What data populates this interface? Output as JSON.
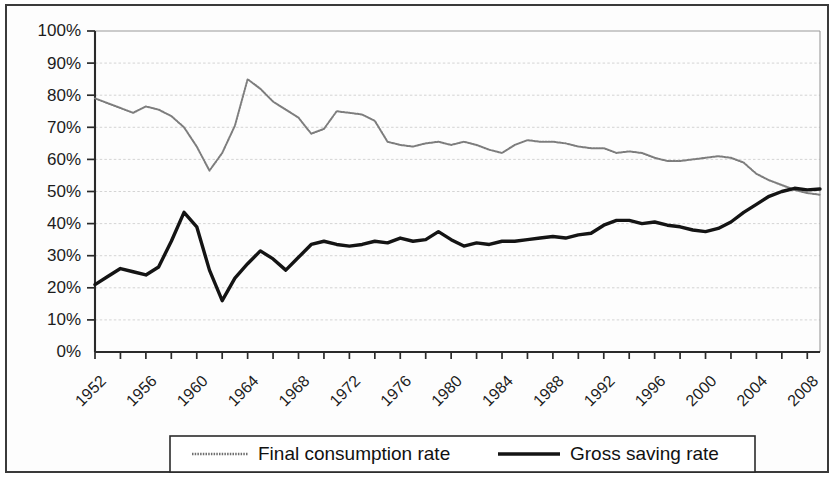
{
  "figure": {
    "width": 835,
    "height": 479,
    "background": "#ffffff",
    "frame_color": "#3a3a3a"
  },
  "legend": {
    "position": "bottom-center",
    "items": [
      {
        "label": "Final consumption rate",
        "marker": "dotted-line",
        "color": "#7d7d7d"
      },
      {
        "label": "Gross saving rate",
        "marker": "solid-line",
        "color": "#141414"
      }
    ]
  },
  "axes": {
    "y_ticks": [
      "0%",
      "10%",
      "20%",
      "30%",
      "40%",
      "50%",
      "60%",
      "70%",
      "80%",
      "90%",
      "100%"
    ],
    "x_ticks": [
      "1952",
      "1956",
      "1960",
      "1964",
      "1968",
      "1972",
      "1976",
      "1980",
      "1984",
      "1988",
      "1992",
      "1996",
      "2000",
      "2004",
      "2008"
    ],
    "x_tick_rotation": "-45"
  },
  "chart_data": {
    "type": "line",
    "title": "",
    "subtitle": "",
    "xlabel": "",
    "ylabel": "",
    "xlim": [
      1952,
      2009
    ],
    "ylim": [
      0,
      100
    ],
    "y_unit": "percent",
    "y_tick_step": 10,
    "x_tick_step": 4,
    "grid": true,
    "grid_axis": "y",
    "legend_position": "bottom-center",
    "x": [
      1952,
      1953,
      1954,
      1955,
      1956,
      1957,
      1958,
      1959,
      1960,
      1961,
      1962,
      1963,
      1964,
      1965,
      1966,
      1967,
      1968,
      1969,
      1970,
      1971,
      1972,
      1973,
      1974,
      1975,
      1976,
      1977,
      1978,
      1979,
      1980,
      1981,
      1982,
      1983,
      1984,
      1985,
      1986,
      1987,
      1988,
      1989,
      1990,
      1991,
      1992,
      1993,
      1994,
      1995,
      1996,
      1997,
      1998,
      1999,
      2000,
      2001,
      2002,
      2003,
      2004,
      2005,
      2006,
      2007,
      2008,
      2009
    ],
    "series": [
      {
        "name": "Final consumption rate",
        "color": "#7d7d7d",
        "style": "dotted",
        "values": [
          79.0,
          77.5,
          76.0,
          74.5,
          76.5,
          75.5,
          73.5,
          70.0,
          64.0,
          56.5,
          62.0,
          70.5,
          85.0,
          82.0,
          78.0,
          75.5,
          73.0,
          68.0,
          69.5,
          75.0,
          74.5,
          74.0,
          72.0,
          65.5,
          64.5,
          64.0,
          65.0,
          65.5,
          64.5,
          65.5,
          64.5,
          63.0,
          62.0,
          64.5,
          66.0,
          65.5,
          65.5,
          65.0,
          64.0,
          63.5,
          63.5,
          62.0,
          62.5,
          62.0,
          60.5,
          59.5,
          59.5,
          60.0,
          60.5,
          61.0,
          60.5,
          59.0,
          55.5,
          53.5,
          52.0,
          50.5,
          49.5,
          49.0
        ]
      },
      {
        "name": "Gross saving rate",
        "color": "#141414",
        "style": "solid",
        "values": [
          21.0,
          23.5,
          26.0,
          25.0,
          24.0,
          26.5,
          34.5,
          43.5,
          39.0,
          25.5,
          16.0,
          23.0,
          27.5,
          31.5,
          29.0,
          25.5,
          29.5,
          33.5,
          34.5,
          33.5,
          33.0,
          33.5,
          34.5,
          34.0,
          35.5,
          34.5,
          35.0,
          37.5,
          35.0,
          33.0,
          34.0,
          33.5,
          34.5,
          34.5,
          35.0,
          35.5,
          36.0,
          35.5,
          36.5,
          37.0,
          39.5,
          41.0,
          41.0,
          40.0,
          40.5,
          39.5,
          39.0,
          38.0,
          37.5,
          38.5,
          40.5,
          43.5,
          46.0,
          48.5,
          50.0,
          51.0,
          50.5,
          50.8
        ]
      }
    ]
  }
}
